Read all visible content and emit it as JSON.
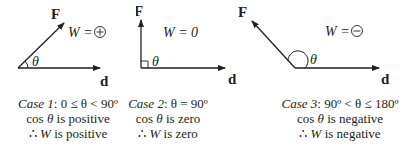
{
  "diagram": {
    "vector_labels": {
      "force": "F",
      "displacement": "d",
      "angle": "θ"
    },
    "cases": [
      {
        "id": "case-1",
        "work_label": "W =",
        "work_symbol": "+",
        "case_label": "Case 1",
        "condition": ": 0 ≤ θ < 90º",
        "cos_line_prefix": "cos ",
        "cos_theta": "θ",
        "cos_line_suffix": " is positive",
        "therefore": "∴ ",
        "work_var": "W",
        "conclusion": " is positive"
      },
      {
        "id": "case-2",
        "work_label": "W = 0",
        "work_symbol": "",
        "case_label": "Case 2",
        "condition": ": θ = 90º",
        "cos_line_prefix": "cos ",
        "cos_theta": "θ",
        "cos_line_suffix": " is zero",
        "therefore": "∴ ",
        "work_var": "W",
        "conclusion": " is zero"
      },
      {
        "id": "case-3",
        "work_label": "W =",
        "work_symbol": "−",
        "case_label": "Case 3",
        "condition": ": 90º < θ ≤ 180º",
        "cos_line_prefix": "cos ",
        "cos_theta": "θ",
        "cos_line_suffix": " is negative",
        "therefore": "∴ ",
        "work_var": "W",
        "conclusion": " is negative"
      }
    ],
    "colors": {
      "ink": "#231f20",
      "background": "#ffffff"
    }
  }
}
